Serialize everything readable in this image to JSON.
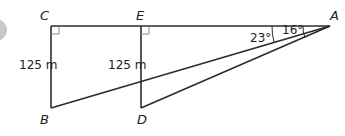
{
  "diagram": {
    "type": "geometry",
    "points": {
      "A": "A",
      "B": "B",
      "C": "C",
      "D": "D",
      "E": "E"
    },
    "lengths": {
      "CB": "125 m",
      "ED": "125 m"
    },
    "angles": {
      "EAD": "16°",
      "DAB": "23°"
    },
    "right_angles": [
      "C",
      "E"
    ],
    "colors": {
      "line": "#2b2b2b",
      "right_angle_mark": "#8a8a8a",
      "badge": "#b5b5b5"
    }
  }
}
